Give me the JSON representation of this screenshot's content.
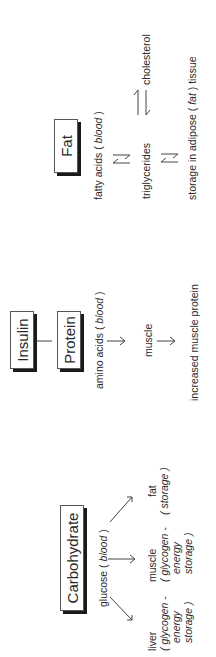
{
  "hormone": {
    "label": "Insulin"
  },
  "carbohydrate": {
    "title": "Carbohydrate",
    "source": {
      "name": "glucose",
      "location": "blood"
    },
    "targets": [
      {
        "name": "liver",
        "detail_line1": "( glycogen -",
        "detail_line2": "energy",
        "detail_line3": "storage )"
      },
      {
        "name": "muscle",
        "detail_line1": "( glycogen -",
        "detail_line2": "energy",
        "detail_line3": "storage )"
      },
      {
        "name": "fat",
        "detail_line1": "( storage )"
      }
    ]
  },
  "protein": {
    "title": "Protein",
    "source": {
      "name": "amino acids",
      "location": "blood"
    },
    "step1": "muscle",
    "step2": "increased muscle protein"
  },
  "fat": {
    "title": "Fat",
    "source": {
      "name": "fatty acids",
      "location": "blood"
    },
    "step1": "triglycerides",
    "side": "cholesterol",
    "step2_prefix": "storage in adipose (",
    "step2_italic": "fat",
    "step2_suffix": ") tissue"
  },
  "punct": {
    "open": "(",
    "close": ")"
  }
}
